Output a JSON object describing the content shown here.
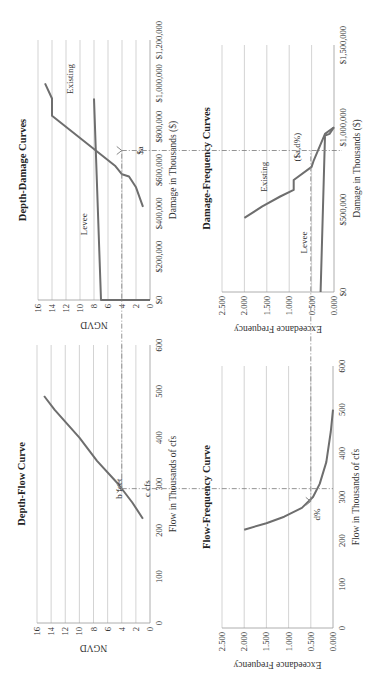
{
  "figure": {
    "orientation": "rotated -90 degrees (reads bottom-to-top)",
    "guide_labels": {
      "b_feet": "b feet",
      "c_cfs": "c cfs",
      "d_pct": "d%",
      "dollar_a": "$a",
      "dollar_a_d": "($a,d%)"
    }
  },
  "chart_data": [
    {
      "id": "depth_flow",
      "type": "line",
      "title": "Depth-Flow Curve",
      "xlabel": "Flow in Thousands of cfs",
      "ylabel": "NGVD",
      "xlim": [
        0,
        600
      ],
      "ylim": [
        0,
        16
      ],
      "x_ticks": [
        "0",
        "100",
        "200",
        "300",
        "400",
        "500",
        "600"
      ],
      "y_ticks": [
        "0",
        "2",
        "4",
        "6",
        "8",
        "10",
        "12",
        "14",
        "16"
      ],
      "grid": "horizontal",
      "series": [
        {
          "name": "Depth-Flow",
          "x": [
            225,
            260,
            300,
            350,
            400,
            460,
            490
          ],
          "y": [
            1,
            2.5,
            4.5,
            7.5,
            10,
            13.5,
            15
          ]
        }
      ],
      "annotations": [
        {
          "text": "b feet",
          "x": 290,
          "y": 4
        },
        {
          "text": "c cfs",
          "x": 290,
          "y": 0
        }
      ]
    },
    {
      "id": "depth_damage",
      "type": "line",
      "title": "Depth-Damage Curves",
      "xlabel": "Damage in Thousands ($)",
      "ylabel": "NGVD",
      "xlim": [
        0,
        1200000
      ],
      "ylim": [
        0,
        16
      ],
      "x_ticks": [
        "$0",
        "$200,000",
        "$400,000",
        "$600,000",
        "$800,000",
        "$1,000,000",
        "$1,200,000"
      ],
      "y_ticks": [
        "0",
        "2",
        "4",
        "6",
        "8",
        "10",
        "12",
        "14",
        "16"
      ],
      "grid": "horizontal",
      "series": [
        {
          "name": "Existing",
          "x": [
            430000,
            520000,
            570000,
            580000,
            620000,
            850000,
            930000,
            1000000
          ],
          "y": [
            1,
            2,
            3,
            4,
            5,
            14,
            14,
            15
          ]
        },
        {
          "name": "Levee",
          "x": [
            0,
            0,
            930000
          ],
          "y": [
            0,
            7,
            8
          ]
        }
      ],
      "annotations": [
        {
          "text": "Existing",
          "x": 1020000,
          "y": 11
        },
        {
          "text": "Levee",
          "x": 350000,
          "y": 9
        },
        {
          "text": "$a",
          "x": 690000,
          "y": 1
        }
      ]
    },
    {
      "id": "flow_frequency",
      "type": "line",
      "title": "Flow-Frequency Curve",
      "xlabel": "Flow in Thousands of cfs",
      "ylabel": "Exceedance Frequency",
      "xlim": [
        0,
        600
      ],
      "ylim": [
        0,
        2.5
      ],
      "x_ticks": [
        "0",
        "100",
        "200",
        "300",
        "400",
        "500",
        "600"
      ],
      "y_ticks": [
        "0.000",
        "0.500",
        "1.000",
        "1.500",
        "2.000",
        "2.500"
      ],
      "grid": "horizontal",
      "series": [
        {
          "name": "Flow-Frequency",
          "x": [
            225,
            240,
            255,
            275,
            300,
            330,
            380,
            450,
            500
          ],
          "y": [
            2.0,
            1.5,
            1.1,
            0.7,
            0.45,
            0.3,
            0.15,
            0.05,
            0.0
          ]
        }
      ],
      "annotations": [
        {
          "text": "d%",
          "x": 260,
          "y": 0.3
        }
      ]
    },
    {
      "id": "damage_frequency",
      "type": "line",
      "title": "Damage-Frequency Curves",
      "xlabel": "Damage in Thousands ($)",
      "ylabel": "Exceedance Frequency",
      "xlim": [
        0,
        1500000
      ],
      "ylim": [
        0,
        2.5
      ],
      "x_ticks": [
        "$0",
        "$500,000",
        "$1,000,000",
        "$1,500,000"
      ],
      "y_ticks": [
        "0.000",
        "0.500",
        "1.000",
        "1.500",
        "2.000",
        "2.500"
      ],
      "grid": "horizontal",
      "series": [
        {
          "name": "Existing",
          "x": [
            450000,
            520000,
            580000,
            620000,
            680000,
            760000,
            800000,
            960000,
            1000000
          ],
          "y": [
            2.0,
            1.6,
            1.2,
            0.9,
            0.9,
            0.5,
            0.45,
            0.2,
            0.0
          ]
        },
        {
          "name": "Levee",
          "x": [
            0,
            950000,
            960000,
            1000000
          ],
          "y": [
            0.3,
            0.2,
            0.1,
            0.0
          ]
        }
      ],
      "annotations": [
        {
          "text": "Existing",
          "x": 700000,
          "y": 1.5
        },
        {
          "text": "Levee",
          "x": 300000,
          "y": 0.6
        },
        {
          "text": "($a,d%)",
          "x": 880000,
          "y": 0.75
        }
      ]
    }
  ]
}
